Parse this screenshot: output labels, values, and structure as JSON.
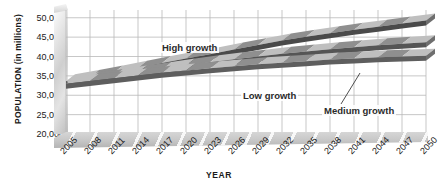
{
  "chart_data": {
    "type": "area",
    "title": "",
    "xlabel": "YEAR",
    "ylabel": "POPULATION (in millions)",
    "ylabel_main": "POPULATION",
    "ylabel_unit": "(in millions)",
    "x": [
      2005,
      2008,
      2011,
      2014,
      2017,
      2020,
      2023,
      2026,
      2029,
      2032,
      2035,
      2038,
      2041,
      2044,
      2047,
      2050
    ],
    "xtick_labels": [
      "2005",
      "2008",
      "2011",
      "2014",
      "2017",
      "2020",
      "2023",
      "2026",
      "2029",
      "2032",
      "2035",
      "2038",
      "2041",
      "2044",
      "2047",
      "2050"
    ],
    "ytick_labels": [
      "50,000",
      "45,000",
      "40,000",
      "35,000",
      "30,000",
      "25,000",
      "20,000"
    ],
    "ytick_values": [
      50000,
      45000,
      40000,
      35000,
      30000,
      25000,
      20000
    ],
    "ylim": [
      20000,
      52000
    ],
    "xlim": [
      2005,
      2050
    ],
    "grid": true,
    "legend_position": "inline-annotations",
    "series": [
      {
        "name": "High growth",
        "label": "High growth",
        "color": "#9a9a9a",
        "edge_color": "#4a4a4a",
        "values": [
          33600,
          34700,
          35900,
          37100,
          38300,
          39500,
          40600,
          41800,
          43000,
          44100,
          45100,
          46000,
          46900,
          47700,
          48500,
          49300
        ]
      },
      {
        "name": "Medium growth",
        "label": "Medium growth",
        "color": "#a8a8a8",
        "edge_color": "#555555",
        "values": [
          33300,
          34100,
          35000,
          35900,
          36800,
          37700,
          38500,
          39300,
          40000,
          40700,
          41300,
          41900,
          42400,
          42900,
          43300,
          43700
        ]
      },
      {
        "name": "Low growth",
        "label": "Low growth",
        "color": "#b4b4b4",
        "edge_color": "#5e5e5e",
        "values": [
          33000,
          33700,
          34400,
          35100,
          35800,
          36400,
          37000,
          37500,
          38000,
          38400,
          38800,
          39200,
          39500,
          39800,
          40000,
          40200
        ]
      }
    ],
    "annotations": [
      {
        "text": "High growth",
        "series": "High growth"
      },
      {
        "text": "Low growth",
        "series": "Low growth"
      },
      {
        "text": "Medium growth",
        "series": "Medium growth",
        "has_leader_line": true
      }
    ]
  }
}
